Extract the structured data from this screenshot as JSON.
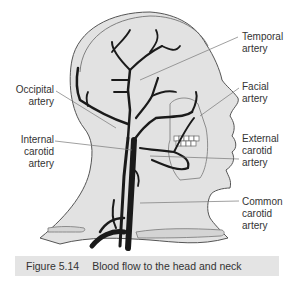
{
  "figure": {
    "number": "Figure 5.14",
    "title": "Blood flow to the head and neck"
  },
  "labels": {
    "temporal": {
      "line1": "Temporal",
      "line2": "artery"
    },
    "facial": {
      "line1": "Facial",
      "line2": "artery"
    },
    "external_carotid": {
      "line1": "External",
      "line2": "carotid",
      "line3": "artery"
    },
    "common_carotid": {
      "line1": "Common",
      "line2": "carotid",
      "line3": "artery"
    },
    "occipital": {
      "line1": "Occipital",
      "line2": "artery"
    },
    "internal_carotid": {
      "line1": "Internal",
      "line2": "carotid",
      "line3": "artery"
    }
  },
  "colors": {
    "head_fill": "#e2e2e2",
    "outline": "#555555",
    "artery": "#1a1a1a",
    "caption_bg": "#e4e4e4"
  }
}
